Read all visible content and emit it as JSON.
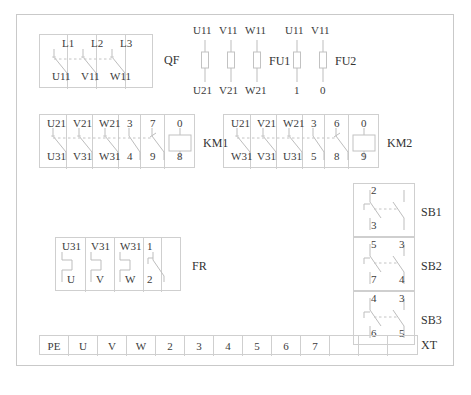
{
  "diagram": {
    "title_caption": "",
    "devices": {
      "qf": {
        "name": "QF",
        "top_labels": [
          "L1",
          "L2",
          "L3"
        ],
        "bottom_labels": [
          "U11",
          "V11",
          "W11"
        ],
        "pole_count": 3,
        "contact_type": "normally-open-switch"
      },
      "fu1": {
        "name": "FU1",
        "top_labels": [
          "U11",
          "V11",
          "W11"
        ],
        "bottom_labels": [
          "U21",
          "V21",
          "W21"
        ],
        "fuse_count": 3
      },
      "fu2": {
        "name": "FU2",
        "top_labels": [
          "U11",
          "V11"
        ],
        "bottom_labels": [
          "1",
          "0"
        ],
        "fuse_count": 2
      },
      "km1": {
        "name": "KM1",
        "top_labels": [
          "U21",
          "V21",
          "W21",
          "3",
          "7",
          "0"
        ],
        "bottom_labels": [
          "U31",
          "V31",
          "W31",
          "4",
          "9",
          "8"
        ],
        "main_poles": 3,
        "aux_contacts": 2,
        "has_coil": true
      },
      "km2": {
        "name": "KM2",
        "top_labels": [
          "U21",
          "V21",
          "W21",
          "3",
          "6",
          "0"
        ],
        "bottom_labels": [
          "W31",
          "V31",
          "U31",
          "5",
          "8",
          "9"
        ],
        "main_poles": 3,
        "aux_contacts": 2,
        "has_coil": true
      },
      "fr": {
        "name": "FR",
        "top_labels": [
          "U31",
          "V31",
          "W31",
          "1"
        ],
        "bottom_labels": [
          "U",
          "V",
          "W",
          "2"
        ],
        "heater_count": 3,
        "aux_contacts": 1
      },
      "sb1": {
        "name": "SB1",
        "top_labels": [
          "2",
          ""
        ],
        "bottom_labels": [
          "3",
          ""
        ],
        "nc_contact": true,
        "no_contact": true
      },
      "sb2": {
        "name": "SB2",
        "top_labels": [
          "5",
          "3"
        ],
        "bottom_labels": [
          "7",
          "4"
        ],
        "nc_contact": true,
        "no_contact": true
      },
      "sb3": {
        "name": "SB3",
        "top_labels": [
          "4",
          "3"
        ],
        "bottom_labels": [
          "6",
          "5"
        ],
        "nc_contact": true,
        "no_contact": true
      },
      "xt": {
        "name": "XT",
        "terminals": [
          "PE",
          "U",
          "V",
          "W",
          "2",
          "3",
          "4",
          "5",
          "6",
          "7",
          "",
          "",
          ""
        ]
      }
    },
    "colors": {
      "line": "#c2c2c2",
      "text": "#3b3b3b",
      "border": "#c9c9c9",
      "background": "#ffffff"
    }
  }
}
